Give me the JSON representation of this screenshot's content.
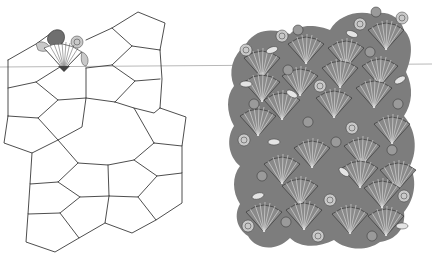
{
  "figure": {
    "panels": [
      {
        "id": "left",
        "name": "pentagon-tiling-outline",
        "style": "line drawing",
        "stroke": "#3a3a3a",
        "sample_motif": "scallop shell in top-left tile"
      },
      {
        "id": "right",
        "name": "shell-tessellation",
        "style": "grayscale stippled illustration",
        "motifs": [
          "scallop shell",
          "spiral snail shell",
          "sea urchin",
          "cowrie shell"
        ]
      }
    ],
    "horizontal_rule": {
      "y": 66,
      "color": "#b8b8b8"
    }
  },
  "colors": {
    "background": "#ffffff",
    "line": "#3a3a3a",
    "shell_dark": "#5e5e5e",
    "shell_mid": "#8a8a8a",
    "shell_light": "#d6d6d6"
  }
}
